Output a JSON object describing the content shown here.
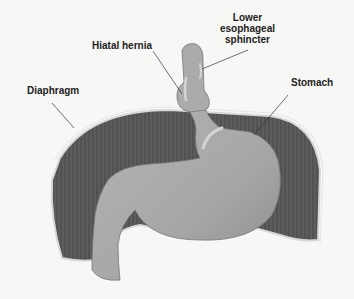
{
  "diagram": {
    "labels": [
      {
        "id": "lower-esophageal-sphincter",
        "lines": [
          "Lower",
          "esophageal",
          "sphincter"
        ]
      },
      {
        "id": "hiatal-hernia",
        "text": "Hiatal hernia"
      },
      {
        "id": "stomach",
        "text": "Stomach"
      },
      {
        "id": "diaphragm",
        "text": "Diaphragm"
      }
    ],
    "colors": {
      "background": "#f7f7f5",
      "diaphragm": "#5c5c5c",
      "diaphragm_rim": "#d8d8d8",
      "stomach": "#a9a9a9",
      "stomach_shadow": "#8a8a8a",
      "highlight": "#d4d4d4",
      "leader_line": "#333333",
      "text": "#222222"
    }
  }
}
